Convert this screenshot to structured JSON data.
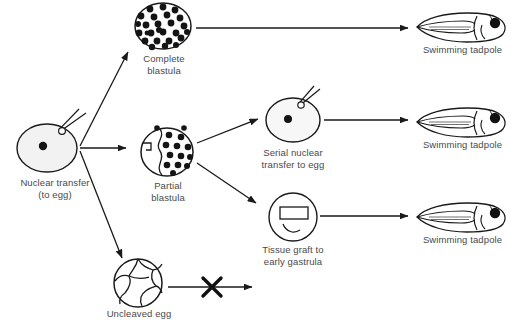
{
  "diagram": {
    "type": "nuclear-transfer-cloning-flow",
    "ink_color": "#1a1a1a",
    "label_color": "#444444",
    "cell_fill": "#f2f2f2",
    "background": "#ffffff",
    "nodes": [
      {
        "id": "donor-egg",
        "label": "Nuclear transfer\n(to egg)",
        "shape": "egg-with-pipette",
        "cx": 47,
        "cy": 148,
        "rx": 30,
        "ry": 24,
        "nucleus": true
      },
      {
        "id": "complete-blastula",
        "label": "Complete\nblastula",
        "shape": "blastula-full",
        "cx": 163,
        "cy": 26,
        "rx": 28,
        "ry": 23,
        "dot_count": 27
      },
      {
        "id": "partial-blastula",
        "label": "Partial\nblastula",
        "shape": "blastula-partial",
        "cx": 167,
        "cy": 152,
        "rx": 26,
        "ry": 24,
        "dot_count": 14
      },
      {
        "id": "uncleaved-egg",
        "label": "Uncleaved egg",
        "shape": "cracked-egg",
        "cx": 138,
        "cy": 283,
        "rx": 25,
        "ry": 23
      },
      {
        "id": "serial-transfer",
        "label": "Serial nuclear\ntransfer to egg",
        "shape": "egg-with-pipette",
        "cx": 293,
        "cy": 120,
        "rx": 27,
        "ry": 22,
        "nucleus": true
      },
      {
        "id": "tissue-graft",
        "label": "Tissue graft to\nearly gastrula",
        "shape": "gastrula-graft",
        "cx": 293,
        "cy": 217,
        "rx": 26,
        "ry": 24
      },
      {
        "id": "tadpole-top",
        "label": "Swimming tadpole",
        "shape": "tadpole",
        "cx": 462,
        "cy": 25
      },
      {
        "id": "tadpole-middle",
        "label": "Swimming tadpole",
        "shape": "tadpole",
        "cx": 462,
        "cy": 120
      },
      {
        "id": "tadpole-bottom",
        "label": "Swimming tadpole",
        "shape": "tadpole",
        "cx": 462,
        "cy": 215
      }
    ],
    "arrows": [
      {
        "id": "egg-to-complete",
        "from": "donor-egg",
        "to": "complete-blastula"
      },
      {
        "id": "egg-to-partial",
        "from": "donor-egg",
        "to": "partial-blastula"
      },
      {
        "id": "egg-to-uncleaved",
        "from": "donor-egg",
        "to": "uncleaved-egg"
      },
      {
        "id": "complete-to-tadpole",
        "from": "complete-blastula",
        "to": "tadpole-top"
      },
      {
        "id": "partial-to-serial",
        "from": "partial-blastula",
        "to": "serial-transfer"
      },
      {
        "id": "partial-to-graft",
        "from": "partial-blastula",
        "to": "tissue-graft"
      },
      {
        "id": "serial-to-tadpole",
        "from": "serial-transfer",
        "to": "tadpole-middle"
      },
      {
        "id": "graft-to-tadpole",
        "from": "tissue-graft",
        "to": "tadpole-bottom"
      },
      {
        "id": "uncleaved-blocked",
        "from": "uncleaved-egg",
        "to": "none",
        "blocked": true,
        "marker": "X"
      }
    ]
  }
}
